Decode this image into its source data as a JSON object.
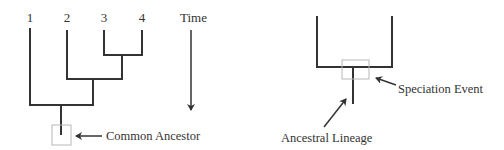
{
  "left_diagram": {
    "taxa": [
      {
        "label": "1"
      },
      {
        "label": "2"
      },
      {
        "label": "3"
      },
      {
        "label": "4"
      }
    ],
    "time_label": "Time",
    "common_ancestor_label": "Common Ancestor"
  },
  "right_diagram": {
    "speciation_label": "Speciation Event",
    "lineage_label": "Ancestral Lineage"
  },
  "colors": {
    "line": "#333333",
    "box": "#b8b8b8",
    "text": "#333333"
  }
}
